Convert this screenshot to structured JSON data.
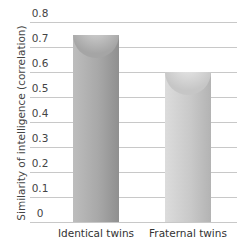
{
  "chart_data": {
    "type": "bar",
    "title": "",
    "xlabel": "",
    "ylabel": "Similarity of intelligence (correlation)",
    "categories": [
      "Identical twins",
      "Fraternal twins"
    ],
    "values": [
      0.75,
      0.6
    ],
    "ylim": [
      0,
      0.8
    ],
    "yticks": [
      "0",
      "0.1",
      "0.2",
      "0.3",
      "0.4",
      "0.5",
      "0.6",
      "0.7",
      "0.8"
    ],
    "grid": true,
    "legend": null
  }
}
